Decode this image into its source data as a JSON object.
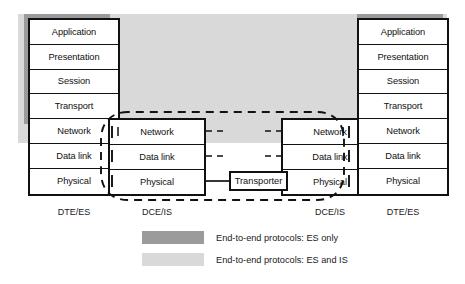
{
  "diagram": {
    "colors": {
      "band_es_only": "#9b9b9b",
      "band_es_and_is": "#d9d9d9",
      "line": "#111111",
      "box_fill": "#ffffff"
    },
    "nodes": [
      {
        "id": "dte-es-left",
        "caption": "DTE/ES",
        "kind": "end-system",
        "layers": [
          "Application",
          "Presentation",
          "Session",
          "Transport",
          "Network",
          "Data link",
          "Physical"
        ]
      },
      {
        "id": "dce-is-left",
        "caption": "DCE/IS",
        "kind": "intermediate-system",
        "layers": [
          "Network",
          "Data link",
          "Physical"
        ]
      },
      {
        "id": "dce-is-right",
        "caption": "DCE/IS",
        "kind": "intermediate-system",
        "layers": [
          "Network",
          "Data link",
          "Physical"
        ]
      },
      {
        "id": "dte-es-right",
        "caption": "DTE/ES",
        "kind": "end-system",
        "layers": [
          "Application",
          "Presentation",
          "Session",
          "Transport",
          "Network",
          "Data link",
          "Physical"
        ]
      }
    ],
    "transporter": {
      "label": "Transporter"
    },
    "legend": [
      {
        "swatch_color": "#9b9b9b",
        "label": "End-to-end protocols: ES only"
      },
      {
        "swatch_color": "#d9d9d9",
        "label": "End-to-end protocols: ES and IS"
      }
    ]
  }
}
